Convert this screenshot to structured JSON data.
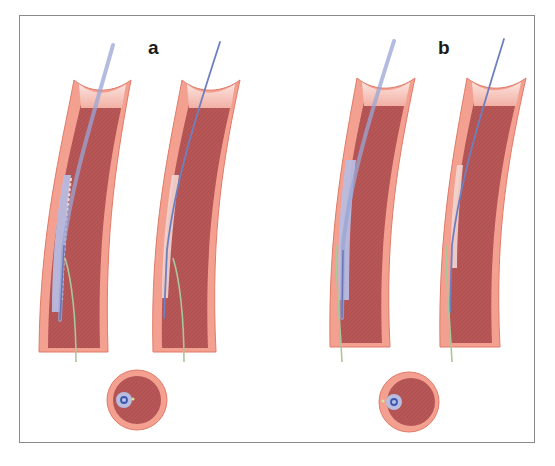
{
  "figure": {
    "panels": [
      {
        "id": "a",
        "label": "a",
        "label_pos": [
          148,
          38
        ],
        "vessels": [
          {
            "name": "vessel-a1",
            "outer_left": "M 75 82 C 62 150, 42 230, 42 350",
            "outer_right": "M 128 82 C 115 150, 102 230, 106 350",
            "wire_start": [
              113,
              45
            ],
            "wire_path": "M 113 45 C 95 110, 72 180, 63 250 L 60 320",
            "sheath_path": "M 68 180 C 60 215, 54 255, 54 300",
            "green_wire_path": "M 65 258 C 72 280, 76 320, 76 362"
          },
          {
            "name": "vessel-a2",
            "outer_left": "M 183 82 C 170 150, 152 230, 156 350",
            "outer_right": "M 238 82 C 226 150, 212 230, 214 350",
            "wire_start": [
              220,
              42
            ],
            "wire_path": "M 220 42 C 198 110, 175 180, 167 250 L 164 318",
            "sheath_path": "M 176 180 C 168 215, 165 255, 166 300",
            "green_wire_path": "M 173 258 C 180 280, 184 320, 184 362"
          }
        ],
        "cross_section": {
          "cx": 137,
          "cy": 400,
          "r": 30,
          "catheter_offset": [
            -13,
            0
          ],
          "green_offset": [
            -4,
            -1
          ]
        }
      },
      {
        "id": "b",
        "label": "b",
        "label_pos": [
          438,
          38
        ],
        "vessels": [
          {
            "name": "vessel-b1",
            "outer_left": "M 358 80 C 345 150, 330 230, 333 345",
            "outer_right": "M 412 80 C 400 150, 383 230, 388 345",
            "wire_start": [
              394,
              41
            ],
            "wire_path": "M 394 41 C 372 110, 350 180, 343 245 L 342 318",
            "sheath_path": "M 350 165 C 343 210, 340 250, 342 300",
            "green_wire_path": "M 336 245 C 336 285, 340 320, 342 362"
          },
          {
            "name": "vessel-b2",
            "outer_left": "M 468 80 C 455 150, 440 230, 443 345",
            "outer_right": "M 523 80 C 510 150, 494 230, 498 345",
            "wire_start": [
              504,
              39
            ],
            "wire_path": "M 504 39 C 482 110, 460 180, 452 245 L 450 312",
            "sheath_path": "M 460 165 C 454 210, 451 250, 452 268",
            "green_wire_path": "M 446 245 C 446 285, 450 320, 452 362"
          }
        ],
        "cross_section": {
          "cx": 409,
          "cy": 402,
          "r": 30,
          "catheter_offset": [
            -15,
            0
          ],
          "green_offset": [
            -26,
            0
          ]
        }
      }
    ],
    "colors": {
      "frame": "#8a8a8a",
      "vessel_wall": "#f4a090",
      "vessel_wall_edge": "#e07a68",
      "lumen": "#b85a5a",
      "lumen_top": "#f7c2b8",
      "guidewire": "#7e8fc6",
      "sheath": "#b9bde0",
      "green_wire": "#a8c79a",
      "catheter_dot": "#3c58b0",
      "plaque_light": "#f3d6d2"
    }
  }
}
